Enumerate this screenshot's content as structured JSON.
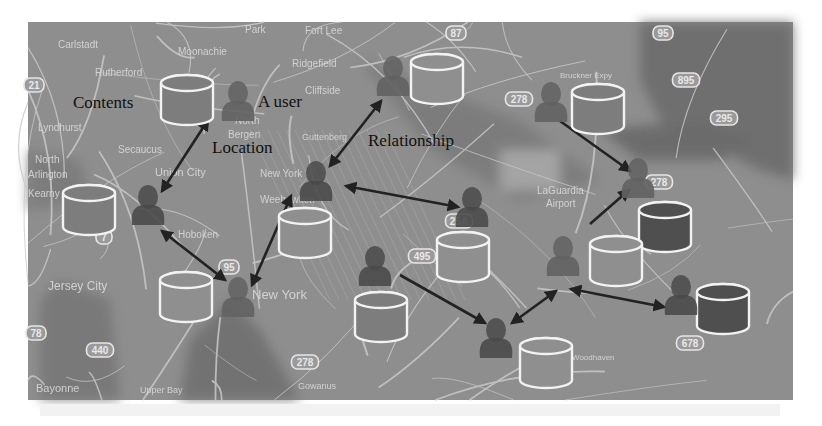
{
  "figure": {
    "width": 822,
    "height": 426,
    "map_frame": {
      "x": 28,
      "y": 22,
      "w": 765,
      "h": 378
    },
    "colors": {
      "background": "#ffffff",
      "map_base": "#8e8e8e",
      "map_dark": "#6f6f6f",
      "water": "#5d5d5d",
      "road": "#c8c8c8",
      "place_label": "#d9d9d9",
      "annotation_text": "#111111",
      "arrow": "#222222",
      "cylinder_stroke": "#f2f2f2",
      "cylinder_fill_mid": "#7d7d7d",
      "cylinder_fill_dark": "#4f4f4f",
      "cylinder_fill_light": "#8f8f8f",
      "user_dark": "#4a4a4a",
      "user_mid": "#626262"
    }
  },
  "annotations": [
    {
      "id": "contents",
      "text": "Contents",
      "x": 73,
      "y": 108,
      "size": 17
    },
    {
      "id": "a-user",
      "text": "A user",
      "x": 258,
      "y": 107,
      "size": 17
    },
    {
      "id": "location",
      "text": "Location",
      "x": 212,
      "y": 153,
      "size": 17
    },
    {
      "id": "relationship",
      "text": "Relationship",
      "x": 368,
      "y": 146,
      "size": 17
    }
  ],
  "place_labels": [
    {
      "text": "Carlstadt",
      "x": 58,
      "y": 48,
      "size": 10
    },
    {
      "text": "Moonachie",
      "x": 178,
      "y": 55,
      "size": 10
    },
    {
      "text": "Park",
      "x": 245,
      "y": 33,
      "size": 10
    },
    {
      "text": "Fort Lee",
      "x": 305,
      "y": 34,
      "size": 10
    },
    {
      "text": "Ridgefield",
      "x": 292,
      "y": 67,
      "size": 10
    },
    {
      "text": "Rutherford",
      "x": 95,
      "y": 76,
      "size": 10
    },
    {
      "text": "Cliffside",
      "x": 305,
      "y": 94,
      "size": 10
    },
    {
      "text": "North",
      "x": 235,
      "y": 124,
      "size": 10
    },
    {
      "text": "Bergen",
      "x": 228,
      "y": 138,
      "size": 10
    },
    {
      "text": "Lyndhurst",
      "x": 38,
      "y": 131,
      "size": 10
    },
    {
      "text": "Guttenberg",
      "x": 302,
      "y": 140,
      "size": 9
    },
    {
      "text": "Secaucus",
      "x": 118,
      "y": 153,
      "size": 10
    },
    {
      "text": "North",
      "x": 35,
      "y": 163,
      "size": 10
    },
    {
      "text": "Arlington",
      "x": 28,
      "y": 178,
      "size": 10
    },
    {
      "text": "Union City",
      "x": 155,
      "y": 176,
      "size": 11
    },
    {
      "text": "New York",
      "x": 260,
      "y": 177,
      "size": 10
    },
    {
      "text": "Weehawken",
      "x": 260,
      "y": 203,
      "size": 10
    },
    {
      "text": "Kearny",
      "x": 28,
      "y": 197,
      "size": 10
    },
    {
      "text": "Hoboken",
      "x": 178,
      "y": 238,
      "size": 10
    },
    {
      "text": "Jersey City",
      "x": 48,
      "y": 290,
      "size": 12
    },
    {
      "text": "New York",
      "x": 252,
      "y": 299,
      "size": 13
    },
    {
      "text": "Bayonne",
      "x": 36,
      "y": 392,
      "size": 11
    },
    {
      "text": "Upper Bay",
      "x": 140,
      "y": 393,
      "size": 9
    },
    {
      "text": "Gowanus",
      "x": 298,
      "y": 389,
      "size": 9
    },
    {
      "text": "LaGuardia",
      "x": 537,
      "y": 194,
      "size": 10
    },
    {
      "text": "Airport",
      "x": 546,
      "y": 207,
      "size": 10
    },
    {
      "text": "Bruckner Expy",
      "x": 560,
      "y": 78,
      "size": 8
    },
    {
      "text": "Woodhaven",
      "x": 572,
      "y": 360,
      "size": 8
    }
  ],
  "shields": [
    {
      "text": "87",
      "x": 456,
      "y": 33
    },
    {
      "text": "95",
      "x": 663,
      "y": 33
    },
    {
      "text": "895",
      "x": 686,
      "y": 80
    },
    {
      "text": "295",
      "x": 724,
      "y": 118
    },
    {
      "text": "278",
      "x": 519,
      "y": 99
    },
    {
      "text": "278",
      "x": 659,
      "y": 182
    },
    {
      "text": "25A",
      "x": 459,
      "y": 221
    },
    {
      "text": "495",
      "x": 422,
      "y": 256
    },
    {
      "text": "678",
      "x": 690,
      "y": 343
    },
    {
      "text": "278",
      "x": 305,
      "y": 362
    },
    {
      "text": "440",
      "x": 100,
      "y": 350
    },
    {
      "text": "7",
      "x": 104,
      "y": 237
    },
    {
      "text": "21",
      "x": 34,
      "y": 85
    },
    {
      "text": "78",
      "x": 36,
      "y": 333
    },
    {
      "text": "95",
      "x": 229,
      "y": 267
    }
  ],
  "users": [
    {
      "id": "u1",
      "x": 238,
      "y": 103,
      "tone": "mid"
    },
    {
      "id": "u2",
      "x": 148,
      "y": 207,
      "tone": "dark"
    },
    {
      "id": "u3",
      "x": 238,
      "y": 299,
      "tone": "mid"
    },
    {
      "id": "u4",
      "x": 316,
      "y": 183,
      "tone": "dark"
    },
    {
      "id": "u5",
      "x": 393,
      "y": 78,
      "tone": "mid"
    },
    {
      "id": "u6",
      "x": 472,
      "y": 209,
      "tone": "dark"
    },
    {
      "id": "u7",
      "x": 375,
      "y": 268,
      "tone": "dark"
    },
    {
      "id": "u8",
      "x": 551,
      "y": 104,
      "tone": "mid"
    },
    {
      "id": "u9",
      "x": 638,
      "y": 180,
      "tone": "mid"
    },
    {
      "id": "u10",
      "x": 563,
      "y": 258,
      "tone": "mid"
    },
    {
      "id": "u11",
      "x": 496,
      "y": 340,
      "tone": "dark"
    },
    {
      "id": "u12",
      "x": 681,
      "y": 297,
      "tone": "dark"
    }
  ],
  "contents": [
    {
      "id": "c1",
      "x": 161,
      "y": 75,
      "w": 52,
      "h": 50,
      "tone": "mid"
    },
    {
      "id": "c2",
      "x": 63,
      "y": 185,
      "w": 52,
      "h": 50,
      "tone": "mid"
    },
    {
      "id": "c3",
      "x": 160,
      "y": 272,
      "w": 52,
      "h": 50,
      "tone": "light"
    },
    {
      "id": "c4",
      "x": 279,
      "y": 208,
      "w": 52,
      "h": 50,
      "tone": "light"
    },
    {
      "id": "c5",
      "x": 411,
      "y": 54,
      "w": 52,
      "h": 50,
      "tone": "light"
    },
    {
      "id": "c6",
      "x": 437,
      "y": 232,
      "w": 52,
      "h": 50,
      "tone": "light"
    },
    {
      "id": "c7",
      "x": 355,
      "y": 292,
      "w": 52,
      "h": 50,
      "tone": "mid"
    },
    {
      "id": "c8",
      "x": 572,
      "y": 84,
      "w": 52,
      "h": 50,
      "tone": "mid"
    },
    {
      "id": "c9",
      "x": 639,
      "y": 202,
      "w": 52,
      "h": 50,
      "tone": "dark"
    },
    {
      "id": "c10",
      "x": 590,
      "y": 236,
      "w": 52,
      "h": 50,
      "tone": "light"
    },
    {
      "id": "c11",
      "x": 697,
      "y": 284,
      "w": 52,
      "h": 50,
      "tone": "dark"
    },
    {
      "id": "c12",
      "x": 520,
      "y": 338,
      "w": 52,
      "h": 50,
      "tone": "light"
    }
  ],
  "relationships": [
    {
      "from": [
        208,
        120
      ],
      "to": [
        162,
        191
      ],
      "double": true
    },
    {
      "from": [
        162,
        231
      ],
      "to": [
        225,
        280
      ],
      "double": true
    },
    {
      "from": [
        252,
        285
      ],
      "to": [
        291,
        196
      ],
      "double": true
    },
    {
      "from": [
        330,
        166
      ],
      "to": [
        381,
        101
      ],
      "double": true
    },
    {
      "from": [
        346,
        186
      ],
      "to": [
        458,
        207
      ],
      "double": true
    },
    {
      "from": [
        400,
        275
      ],
      "to": [
        485,
        323
      ],
      "double": false
    },
    {
      "from": [
        560,
        121
      ],
      "to": [
        630,
        171
      ],
      "double": false
    },
    {
      "from": [
        590,
        224
      ],
      "to": [
        629,
        190
      ],
      "double": false
    },
    {
      "from": [
        512,
        323
      ],
      "to": [
        556,
        291
      ],
      "double": true
    },
    {
      "from": [
        571,
        289
      ],
      "to": [
        664,
        307
      ],
      "double": true
    }
  ],
  "caption_fragment": {
    "text": "...(cropped caption text, illegible)...",
    "y": 413
  }
}
